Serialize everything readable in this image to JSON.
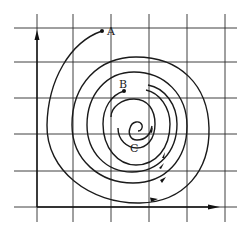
{
  "diagram": {
    "type": "spiral-trajectory-on-grid",
    "colors": {
      "line": "#1a1a1a",
      "grid": "#2a2a2a",
      "background": "#ffffff"
    },
    "grid": {
      "vertical_x": [
        37,
        73,
        111,
        149,
        187,
        225
      ],
      "horizontal_y": [
        28,
        62,
        98,
        134,
        171,
        207
      ]
    },
    "axes": {
      "y_axis": {
        "x": 36,
        "from_y": 218,
        "to_y": 30,
        "arrow": "up"
      },
      "x_axis": {
        "y": 208,
        "from_x": 36,
        "to_x": 222,
        "arrow": "right"
      }
    },
    "points": [
      {
        "label": "A",
        "x": 102,
        "y": 31,
        "label_x": 107,
        "label_y": 35
      },
      {
        "label": "B",
        "x": 124,
        "y": 91,
        "label_x": 119,
        "label_y": 88
      },
      {
        "label": "C",
        "label_x": 130,
        "label_y": 152
      }
    ]
  }
}
